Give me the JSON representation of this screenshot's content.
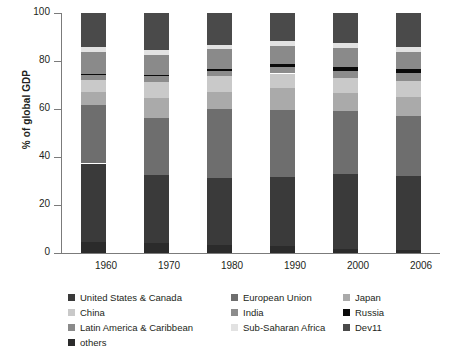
{
  "chart_data": {
    "type": "bar",
    "subtype": "stacked-bar-100-percent",
    "title": "",
    "xlabel": "",
    "ylabel": "% of global GDP",
    "ylim": [
      0,
      100
    ],
    "yticks": [
      0,
      20,
      40,
      60,
      80,
      100
    ],
    "grid": false,
    "legend_position": "bottom",
    "categories": [
      "1960",
      "1970",
      "1980",
      "1990",
      "2000",
      "2006"
    ],
    "stack_order_bottom_to_top": [
      "others",
      "United States & Canada",
      "European Union",
      "Japan",
      "China",
      "India",
      "Russia",
      "Latin America & Caribbean",
      "Sub-Saharan Africa",
      "Dev11"
    ],
    "series": [
      {
        "name": "others",
        "color": "#2b2b2b",
        "values": [
          4.7,
          4.0,
          3.3,
          3.0,
          1.8,
          1.4
        ]
      },
      {
        "name": "United States & Canada",
        "color": "#3a3a3a",
        "values": [
          32.6,
          28.4,
          27.8,
          28.6,
          31.0,
          30.8
        ]
      },
      {
        "name": "European Union",
        "color": "#6e6e6e",
        "values": [
          24.4,
          23.7,
          28.9,
          27.9,
          26.4,
          25.0
        ]
      },
      {
        "name": "Japan",
        "color": "#aaaaaa",
        "values": [
          5.3,
          8.3,
          7.2,
          9.1,
          7.4,
          7.9
        ]
      },
      {
        "name": "China",
        "color": "#c9c9c9",
        "values": [
          4.9,
          6.9,
          6.4,
          6.2,
          6.4,
          6.5
        ]
      },
      {
        "name": "India",
        "color": "#8c8c8c",
        "values": [
          2.3,
          2.4,
          2.3,
          2.7,
          3.0,
          3.4
        ]
      },
      {
        "name": "Russia",
        "color": "#0a0a0a",
        "values": [
          0.5,
          0.6,
          0.8,
          1.4,
          1.4,
          1.6
        ]
      },
      {
        "name": "Latin America & Caribbean",
        "color": "#8a8a8a",
        "values": [
          9.1,
          8.3,
          8.1,
          7.3,
          7.9,
          7.0
        ]
      },
      {
        "name": "Sub-Saharan Africa",
        "color": "#e2e2e2",
        "values": [
          1.9,
          1.9,
          2.0,
          2.3,
          2.3,
          2.4
        ]
      },
      {
        "name": "Dev11",
        "color": "#4a4a4a",
        "values": [
          14.3,
          15.5,
          13.2,
          11.5,
          12.4,
          14.0
        ]
      }
    ]
  },
  "axis": {
    "y_title": "% of global GDP",
    "y_tick_labels": [
      "0",
      "20",
      "40",
      "60",
      "80",
      "100"
    ],
    "x_tick_labels": [
      "1960",
      "1970",
      "1980",
      "1990",
      "2000",
      "2006"
    ]
  },
  "legend": {
    "rows": [
      [
        {
          "label": "United States & Canada",
          "color": "#3a3a3a"
        },
        {
          "label": "European Union",
          "color": "#6e6e6e"
        },
        {
          "label": "Japan",
          "color": "#aaaaaa"
        }
      ],
      [
        {
          "label": "China",
          "color": "#c9c9c9"
        },
        {
          "label": "India",
          "color": "#8c8c8c"
        },
        {
          "label": "Russia",
          "color": "#0a0a0a"
        }
      ],
      [
        {
          "label": "Latin America & Caribbean",
          "color": "#8a8a8a"
        },
        {
          "label": "Sub-Saharan Africa",
          "color": "#e2e2e2"
        },
        {
          "label": "Dev11",
          "color": "#4a4a4a"
        }
      ],
      [
        {
          "label": "others",
          "color": "#2b2b2b"
        }
      ]
    ]
  },
  "colors": {
    "axis": "#7b7b7b",
    "text": "#231f20",
    "background": "#ffffff"
  }
}
